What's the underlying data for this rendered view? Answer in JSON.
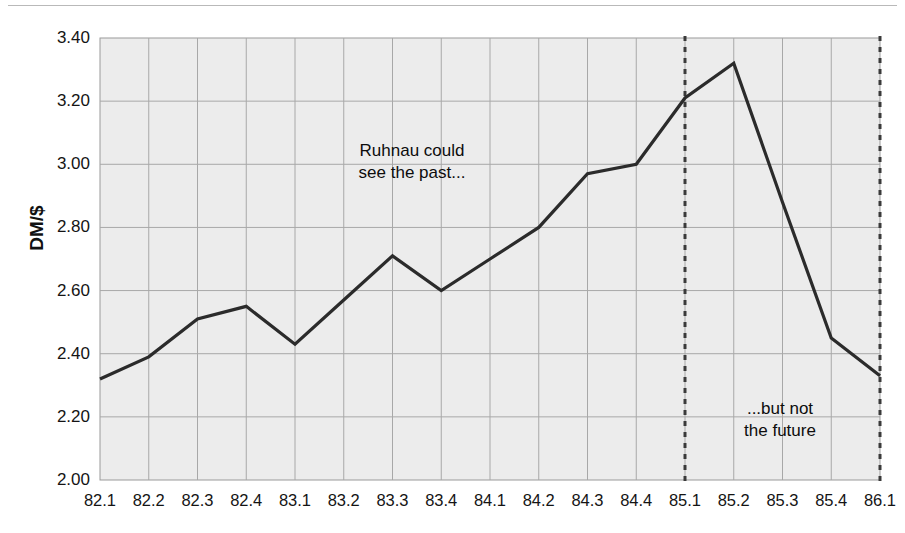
{
  "chart_data": {
    "type": "line",
    "title": "",
    "xlabel": "",
    "ylabel": "DM/$",
    "ylim": [
      2.0,
      3.4
    ],
    "ytick_step": 0.2,
    "grid": true,
    "legend": "none",
    "categories": [
      "82.1",
      "82.2",
      "82.3",
      "82.4",
      "83.1",
      "83.2",
      "83.3",
      "83.4",
      "84.1",
      "84.2",
      "84.3",
      "84.4",
      "85.1",
      "85.2",
      "85.3",
      "85.4",
      "86.1"
    ],
    "values": [
      2.32,
      2.39,
      2.51,
      2.55,
      2.43,
      2.57,
      2.71,
      2.6,
      2.7,
      2.8,
      2.97,
      3.0,
      3.21,
      3.32,
      2.88,
      2.45,
      2.33
    ],
    "ytick_labels": [
      "3.40",
      "3.20",
      "3.00",
      "2.80",
      "2.60",
      "2.40",
      "2.20",
      "2.00"
    ],
    "ytick_values": [
      3.4,
      3.2,
      3.0,
      2.8,
      2.6,
      2.4,
      2.2,
      2.0
    ],
    "series_color": "#2b2b2b",
    "plot_background": "#ececec",
    "grid_color": "#a8a8a8",
    "marker_lines": [
      {
        "name": "marker-85-1",
        "category": "85.1",
        "style": "dashed",
        "color": "#3a3a3a"
      },
      {
        "name": "marker-86-1",
        "category": "86.1",
        "style": "dashed",
        "color": "#3a3a3a"
      }
    ],
    "annotations": [
      {
        "name": "annotation-past",
        "text": "Ruhnau could\nsee the past..."
      },
      {
        "name": "annotation-future",
        "text": "...but not\nthe future"
      }
    ]
  }
}
